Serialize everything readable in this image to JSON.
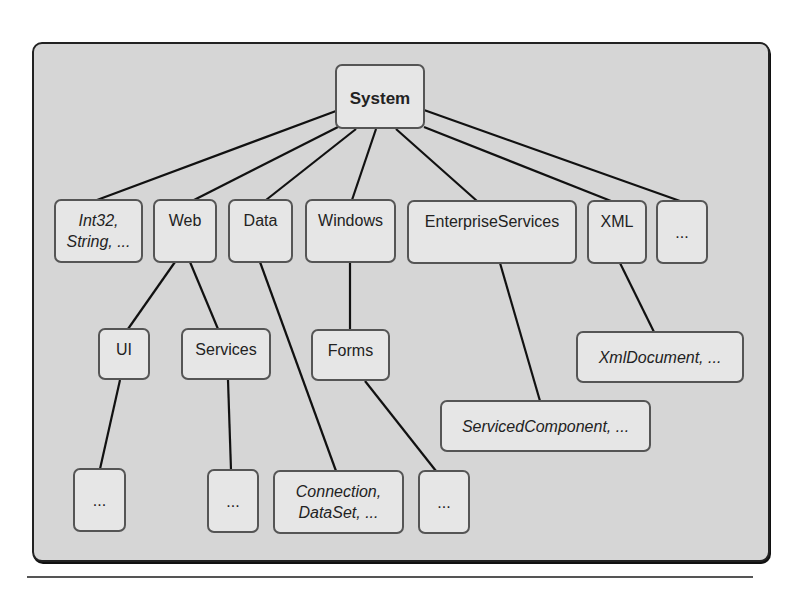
{
  "diagram": {
    "root": "System",
    "nodes": {
      "system": "System",
      "int32": "Int32,\nString, ...",
      "web": "Web",
      "data": "Data",
      "windows": "Windows",
      "enterprise": "EnterpriseServices",
      "xml": "XML",
      "more_top": "...",
      "ui": "UI",
      "services": "Services",
      "forms": "Forms",
      "xmldocument": "XmlDocument, ...",
      "servicedcomponent": "ServicedComponent, ...",
      "ui_more": "...",
      "services_more": "...",
      "connection": "Connection,\nDataSet, ...",
      "forms_more": "..."
    },
    "edges": [
      [
        "System",
        "Int32, String, ..."
      ],
      [
        "System",
        "Web"
      ],
      [
        "System",
        "Data"
      ],
      [
        "System",
        "Windows"
      ],
      [
        "System",
        "EnterpriseServices"
      ],
      [
        "System",
        "XML"
      ],
      [
        "System",
        "..."
      ],
      [
        "Web",
        "UI"
      ],
      [
        "Web",
        "Services"
      ],
      [
        "Data",
        "Connection, DataSet, ..."
      ],
      [
        "Windows",
        "Forms"
      ],
      [
        "EnterpriseServices",
        "ServicedComponent, ..."
      ],
      [
        "XML",
        "XmlDocument, ..."
      ],
      [
        "UI",
        "..."
      ],
      [
        "Services",
        "..."
      ],
      [
        "Forms",
        "..."
      ]
    ]
  },
  "colors": {
    "panel_bg": "#d6d6d6",
    "node_bg": "#e6e6e6",
    "line": "#111111"
  }
}
